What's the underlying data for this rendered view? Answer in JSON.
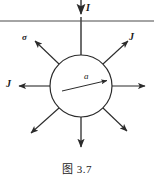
{
  "figure": {
    "caption": "图 3.7",
    "width": 154,
    "height": 181,
    "background_color": "#ffffff",
    "stroke_color": "#2b2b2b",
    "labels": {
      "current_I": "I",
      "conductivity_sigma": "σ",
      "current_density_upper_right": "J",
      "current_density_left": "J",
      "radius_a": "a"
    },
    "geometry": {
      "sphere_center_x": 81,
      "sphere_center_y": 86,
      "sphere_radius": 31,
      "ground_line_y": 21,
      "ground_line_x_start": 0,
      "ground_line_x_end": 154,
      "lead_wire_x": 81,
      "lead_wire_y_start": 0,
      "lead_wire_arrow_y": 17
    },
    "radial_arrows": [
      {
        "name": "arrow-up-right",
        "angle_deg": -45,
        "length": 38,
        "label": "J"
      },
      {
        "name": "arrow-right",
        "angle_deg": 0,
        "length": 37,
        "label": ""
      },
      {
        "name": "arrow-down-right",
        "angle_deg": 45,
        "length": 35,
        "label": ""
      },
      {
        "name": "arrow-down",
        "angle_deg": 90,
        "length": 33,
        "label": ""
      },
      {
        "name": "arrow-down-left",
        "angle_deg": 135,
        "length": 36,
        "label": ""
      },
      {
        "name": "arrow-left",
        "angle_deg": 180,
        "length": 37,
        "label": "J"
      },
      {
        "name": "arrow-up-left",
        "angle_deg": -135,
        "length": 38,
        "label": "σ"
      }
    ],
    "radius_arrow": {
      "from_x": 62,
      "from_y": 91,
      "to_x": 110,
      "to_y": 80,
      "label": "a"
    }
  }
}
